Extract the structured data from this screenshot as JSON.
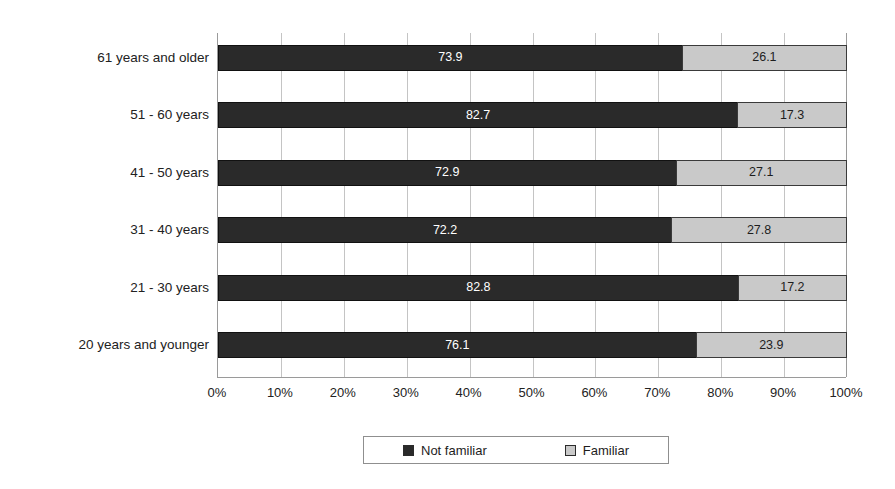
{
  "chart_data": {
    "type": "bar",
    "subtype": "horizontal-100-percent-stacked",
    "title": "",
    "xlabel": "",
    "ylabel": "",
    "xlim": [
      0,
      100
    ],
    "grid": true,
    "legend_position": "bottom",
    "categories": [
      "61 years and older",
      "51 - 60 years",
      "41 - 50 years",
      "31 - 40 years",
      "21 - 30 years",
      "20 years and younger"
    ],
    "series": [
      {
        "name": "Not familiar",
        "color": "#2a2a2a",
        "values": [
          73.9,
          82.7,
          72.9,
          72.2,
          82.8,
          76.1
        ]
      },
      {
        "name": "Familiar",
        "color": "#c9c9c9",
        "values": [
          26.1,
          17.3,
          27.1,
          27.8,
          17.2,
          23.9
        ]
      }
    ],
    "x_tick_labels": [
      "0%",
      "10%",
      "20%",
      "30%",
      "40%",
      "50%",
      "60%",
      "70%",
      "80%",
      "90%",
      "100%"
    ],
    "x_tick_values": [
      0,
      10,
      20,
      30,
      40,
      50,
      60,
      70,
      80,
      90,
      100
    ],
    "bar_labels": [
      [
        "73.9",
        "26.1"
      ],
      [
        "82.7",
        "17.3"
      ],
      [
        "72.9",
        "27.1"
      ],
      [
        "72.2",
        "27.8"
      ],
      [
        "82.8",
        "17.2"
      ],
      [
        "76.1",
        "23.9"
      ]
    ]
  },
  "legend": {
    "items": [
      {
        "label": "Not familiar",
        "color": "#2a2a2a"
      },
      {
        "label": "Familiar",
        "color": "#c9c9c9"
      }
    ]
  },
  "colors": {
    "not_familiar": "#2a2a2a",
    "familiar": "#c9c9c9",
    "gridline": "#c4c4c4",
    "axis": "#9a9a9a",
    "background": "#ffffff"
  }
}
